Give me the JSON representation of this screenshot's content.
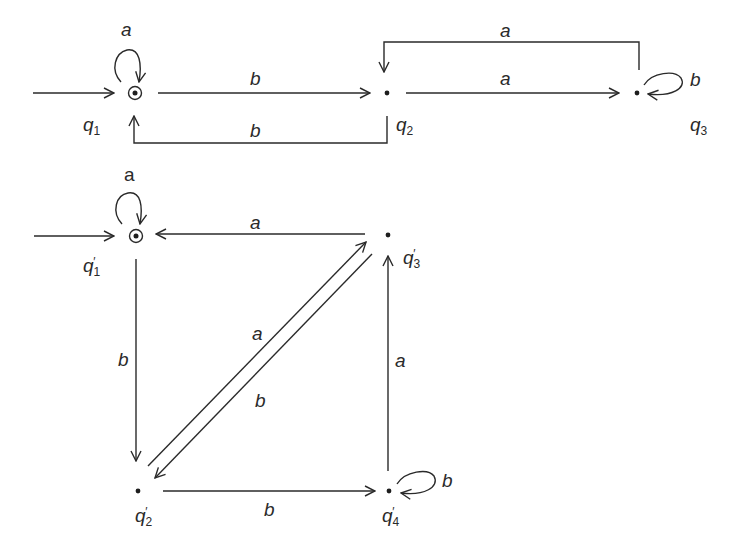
{
  "diagram_1": {
    "title": "DFA M",
    "states": [
      {
        "id": "q1",
        "label": "q",
        "sub": "1",
        "accepting": true,
        "start": true
      },
      {
        "id": "q2",
        "label": "q",
        "sub": "2",
        "accepting": false,
        "start": false
      },
      {
        "id": "q3",
        "label": "q",
        "sub": "3",
        "accepting": false,
        "start": false
      }
    ],
    "transitions": [
      {
        "from": "q1",
        "to": "q1",
        "symbol": "a"
      },
      {
        "from": "q1",
        "to": "q2",
        "symbol": "b"
      },
      {
        "from": "q2",
        "to": "q1",
        "symbol": "b"
      },
      {
        "from": "q2",
        "to": "q3",
        "symbol": "a"
      },
      {
        "from": "q3",
        "to": "q2",
        "symbol": "a"
      },
      {
        "from": "q3",
        "to": "q3",
        "symbol": "b"
      }
    ]
  },
  "diagram_2": {
    "title": "DFA M'",
    "states": [
      {
        "id": "q1p",
        "label": "q",
        "sub": "1",
        "prime": "′",
        "accepting": true,
        "start": true
      },
      {
        "id": "q2p",
        "label": "q",
        "sub": "2",
        "prime": "′",
        "accepting": false,
        "start": false
      },
      {
        "id": "q3p",
        "label": "q",
        "sub": "3",
        "prime": "′",
        "accepting": false,
        "start": false
      },
      {
        "id": "q4p",
        "label": "q",
        "sub": "4",
        "prime": "′",
        "accepting": false,
        "start": false
      }
    ],
    "transitions": [
      {
        "from": "q1p",
        "to": "q1p",
        "symbol": "a"
      },
      {
        "from": "q3p",
        "to": "q1p",
        "symbol": "a"
      },
      {
        "from": "q1p",
        "to": "q2p",
        "symbol": "b"
      },
      {
        "from": "q2p",
        "to": "q3p",
        "symbol": "a"
      },
      {
        "from": "q3p",
        "to": "q2p",
        "symbol": "b"
      },
      {
        "from": "q4p",
        "to": "q3p",
        "symbol": "a"
      },
      {
        "from": "q2p",
        "to": "q4p",
        "symbol": "b"
      },
      {
        "from": "q4p",
        "to": "q4p",
        "symbol": "b"
      }
    ]
  },
  "labels": {
    "d1_loop_q1": "a",
    "d1_q1_q2": "b",
    "d1_q2_q1": "b",
    "d1_q2_q3": "a",
    "d1_q3_q2": "a",
    "d1_loop_q3": "b",
    "d2_loop_q1": "a",
    "d2_q3_q1": "a",
    "d2_q1_q2": "b",
    "d2_q2_q3": "a",
    "d2_q3_q2": "b",
    "d2_q4_q3": "a",
    "d2_q2_q4": "b",
    "d2_loop_q4": "b",
    "q": "q",
    "sub1": "1",
    "sub2": "2",
    "sub3": "3",
    "sub4": "4",
    "prime": "′"
  }
}
